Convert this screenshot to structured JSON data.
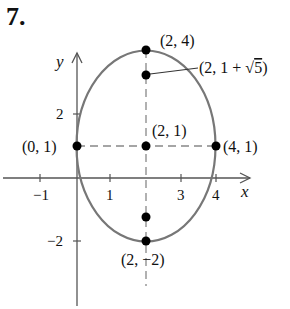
{
  "problem_number": "7.",
  "axes": {
    "x_label": "x",
    "y_label": "y",
    "x_ticks": [
      {
        "value": -1,
        "label": "−1"
      },
      {
        "value": 1,
        "label": "1"
      },
      {
        "value": 3,
        "label": "3"
      },
      {
        "value": 4,
        "label": "4"
      }
    ],
    "y_ticks": [
      {
        "value": 2,
        "label": "2"
      },
      {
        "value": -2,
        "label": "−2"
      }
    ]
  },
  "ellipse": {
    "center": [
      2,
      1
    ],
    "semi_axis_x": 2,
    "semi_axis_y": 3,
    "stroke_color": "#777777"
  },
  "points": [
    {
      "id": "left-vertex",
      "coord": [
        0,
        1
      ],
      "label": "(0, 1)"
    },
    {
      "id": "center",
      "coord": [
        2,
        1
      ],
      "label": "(2, 1)"
    },
    {
      "id": "right-vertex",
      "coord": [
        4,
        1
      ],
      "label": "(4, 1)"
    },
    {
      "id": "top-vertex",
      "coord": [
        2,
        4
      ],
      "label": "(2, 4)"
    },
    {
      "id": "upper-focus",
      "coord": [
        2,
        3.236
      ],
      "label": "(2, 1 + √5)"
    },
    {
      "id": "lower-focus",
      "coord": [
        2,
        -1.236
      ],
      "label": ""
    },
    {
      "id": "bottom-vertex",
      "coord": [
        2,
        -2
      ],
      "label": "(2, −2)"
    }
  ],
  "labels": {
    "top_vertex": "(2, 4)",
    "focus_prefix": "(2, 1 + ",
    "focus_sqrt": "√",
    "focus_radicand": "5",
    "focus_suffix": ")",
    "center": "(2, 1)",
    "left_vertex": "(0, 1)",
    "right_vertex": "(4, 1)",
    "bottom_vertex": "(2, −2)"
  },
  "colors": {
    "curve": "#777777",
    "axis": "#555555",
    "point": "#000000",
    "dash": "#888888"
  }
}
